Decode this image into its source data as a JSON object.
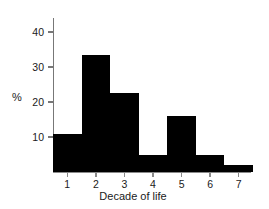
{
  "chart_data": {
    "type": "bar",
    "title": "",
    "subtitle": "",
    "xlabel": "Decade of life",
    "ylabel": "%",
    "categories": [
      "1",
      "2",
      "3",
      "4",
      "5",
      "6",
      "7"
    ],
    "values": [
      11,
      33.5,
      22.5,
      5,
      16,
      5,
      2
    ],
    "series": [
      {
        "name": "percent",
        "values": [
          11,
          33.5,
          22.5,
          5,
          16,
          5,
          2
        ]
      }
    ],
    "ylim": [
      0,
      44
    ],
    "xlim": [
      0.5,
      7.5
    ],
    "yticks": [
      10,
      20,
      30,
      40
    ],
    "ytick_labels": [
      "10",
      "20",
      "30",
      "40"
    ],
    "xticks": [
      1,
      2,
      3,
      4,
      5,
      6,
      7
    ],
    "xtick_labels": [
      "1",
      "2",
      "3",
      "4",
      "5",
      "6",
      "7"
    ],
    "grid": false,
    "legend": null,
    "legend_position": "none",
    "bar_color": "#000000",
    "axis_color": "#7f7f7f",
    "text_color": "#1a1a1a",
    "background": "#ffffff",
    "annotations": []
  },
  "axes": {
    "y_title": "%",
    "x_title": "Decade of life"
  }
}
